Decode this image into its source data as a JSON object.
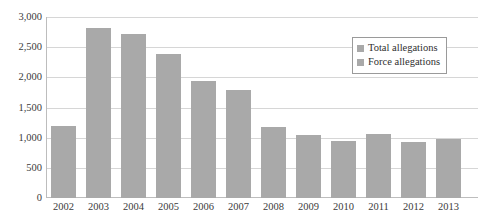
{
  "chart_data": {
    "type": "bar",
    "title": "",
    "xlabel": "",
    "ylabel": "",
    "categories": [
      "2002",
      "2003",
      "2004",
      "2005",
      "2006",
      "2007",
      "2008",
      "2009",
      "2010",
      "2011",
      "2012",
      "2013"
    ],
    "series": [
      {
        "name": "Total allegations",
        "values": [
          1190,
          2820,
          2720,
          2390,
          1940,
          1790,
          1180,
          1040,
          945,
          1060,
          925,
          975
        ]
      }
    ],
    "ylim": [
      0,
      3000
    ],
    "yticks": [
      0,
      500,
      1000,
      1500,
      2000,
      2500,
      3000
    ],
    "ytick_labels": [
      "0",
      "500",
      "1,000",
      "1,500",
      "2,000",
      "2,500",
      "3,000"
    ],
    "grid": true,
    "legend_position": "top-right",
    "bar_color": "#a9a9a9"
  },
  "legend": {
    "entries": [
      {
        "label": "Total allegations",
        "color": "#a9a9a9"
      },
      {
        "label": "Force allegations",
        "color": "#a9a9a9"
      }
    ]
  }
}
